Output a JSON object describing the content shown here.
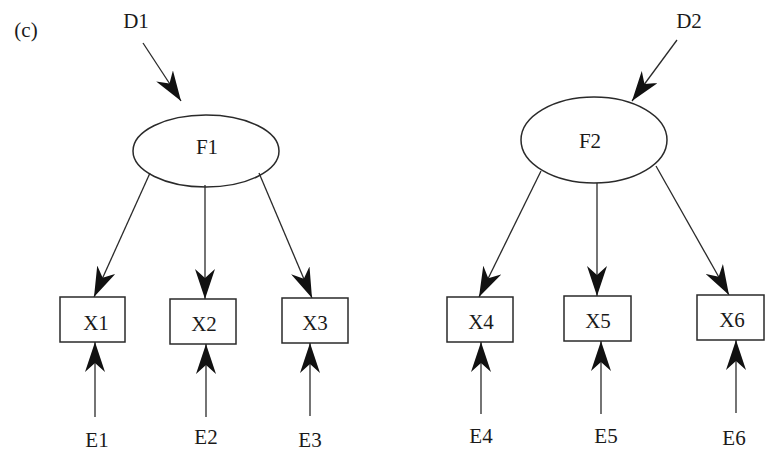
{
  "figure": {
    "panel_label": "(c)",
    "colors": {
      "stroke": "#2a2a2a",
      "arrowhead": "#111111",
      "background": "#ffffff",
      "text": "#1a1a1a"
    }
  },
  "models": [
    {
      "factor": {
        "label": "F1",
        "cx": 206,
        "cy": 150,
        "rx": 72,
        "ry": 36
      },
      "disturbance": {
        "label": "D1",
        "x": 146,
        "y": 20
      },
      "indicators": [
        {
          "label": "X1",
          "x": 60,
          "y": 297,
          "w": 65,
          "h": 45
        },
        {
          "label": "X2",
          "x": 170,
          "y": 299,
          "w": 66,
          "h": 45
        },
        {
          "label": "X3",
          "x": 282,
          "y": 298,
          "w": 66,
          "h": 45
        }
      ],
      "errors": [
        {
          "label": "E1",
          "x": 96,
          "y": 440
        },
        {
          "label": "E2",
          "x": 206,
          "y": 437
        },
        {
          "label": "E3",
          "x": 310,
          "y": 440
        }
      ]
    },
    {
      "factor": {
        "label": "F2",
        "cx": 593,
        "cy": 140,
        "rx": 73,
        "ry": 43
      },
      "disturbance": {
        "label": "D2",
        "x": 690,
        "y": 20
      },
      "indicators": [
        {
          "label": "X4",
          "x": 447,
          "y": 297,
          "w": 66,
          "h": 45
        },
        {
          "label": "X5",
          "x": 564,
          "y": 296,
          "w": 67,
          "h": 45
        },
        {
          "label": "X6",
          "x": 697,
          "y": 295,
          "w": 67,
          "h": 45
        }
      ],
      "errors": [
        {
          "label": "E4",
          "x": 480,
          "y": 436
        },
        {
          "label": "E5",
          "x": 600,
          "y": 436
        },
        {
          "label": "E6",
          "x": 736,
          "y": 438
        }
      ]
    }
  ],
  "labels": {
    "panel": "(c)",
    "D1": "D1",
    "D2": "D2",
    "F1": "F1",
    "F2": "F2",
    "X1": "X1",
    "X2": "X2",
    "X3": "X3",
    "X4": "X4",
    "X5": "X5",
    "X6": "X6",
    "E1": "E1",
    "E2": "E2",
    "E3": "E3",
    "E4": "E4",
    "E5": "E5",
    "E6": "E6"
  },
  "edges": [
    {
      "from": "D1",
      "to": "F1"
    },
    {
      "from": "D2",
      "to": "F2"
    },
    {
      "from": "F1",
      "to": "X1"
    },
    {
      "from": "F1",
      "to": "X2"
    },
    {
      "from": "F1",
      "to": "X3"
    },
    {
      "from": "F2",
      "to": "X4"
    },
    {
      "from": "F2",
      "to": "X5"
    },
    {
      "from": "F2",
      "to": "X6"
    },
    {
      "from": "E1",
      "to": "X1"
    },
    {
      "from": "E2",
      "to": "X2"
    },
    {
      "from": "E3",
      "to": "X3"
    },
    {
      "from": "E4",
      "to": "X4"
    },
    {
      "from": "E5",
      "to": "X5"
    },
    {
      "from": "E6",
      "to": "X6"
    }
  ]
}
